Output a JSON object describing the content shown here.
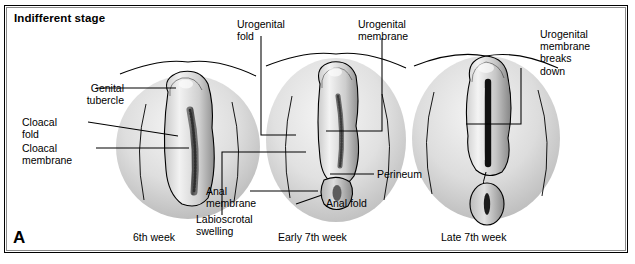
{
  "figure": {
    "panel_letter": "A",
    "stage_title": "Indifferent stage",
    "border_color": "#000000",
    "background_color": "#ffffff",
    "ink_color": "#000000"
  },
  "stages": [
    {
      "id": "sixth-week",
      "caption": "6th week",
      "labels": [
        {
          "id": "genital-tubercle",
          "text_line_1": "Genital",
          "text_line_2": "tubercle"
        },
        {
          "id": "cloacal-fold",
          "text_line_1": "Cloacal",
          "text_line_2": "fold"
        },
        {
          "id": "cloacal-membrane",
          "text_line_1": "Cloacal",
          "text_line_2": "membrane"
        }
      ]
    },
    {
      "id": "early-seventh-week",
      "caption": "Early 7th week",
      "labels": [
        {
          "id": "urogenital-fold",
          "text_line_1": "Urogenital",
          "text_line_2": "fold"
        },
        {
          "id": "urogenital-membrane",
          "text_line_1": "Urogenital",
          "text_line_2": "membrane"
        },
        {
          "id": "labioscrotal-swelling",
          "text_line_1": "Labioscrotal",
          "text_line_2": "swelling"
        },
        {
          "id": "anal-membrane",
          "text_line_1": "Anal",
          "text_line_2": "membrane"
        },
        {
          "id": "perineum",
          "text_line_1": "Perineum",
          "text_line_2": ""
        },
        {
          "id": "anal-fold",
          "text_line_1": "Anal fold",
          "text_line_2": ""
        }
      ]
    },
    {
      "id": "late-seventh-week",
      "caption": "Late 7th week",
      "labels": [
        {
          "id": "urogenital-membrane-breaks-down",
          "text_line_1": "Urogenital",
          "text_line_2": "membrane",
          "text_line_3": "breaks",
          "text_line_4": "down"
        }
      ]
    }
  ]
}
